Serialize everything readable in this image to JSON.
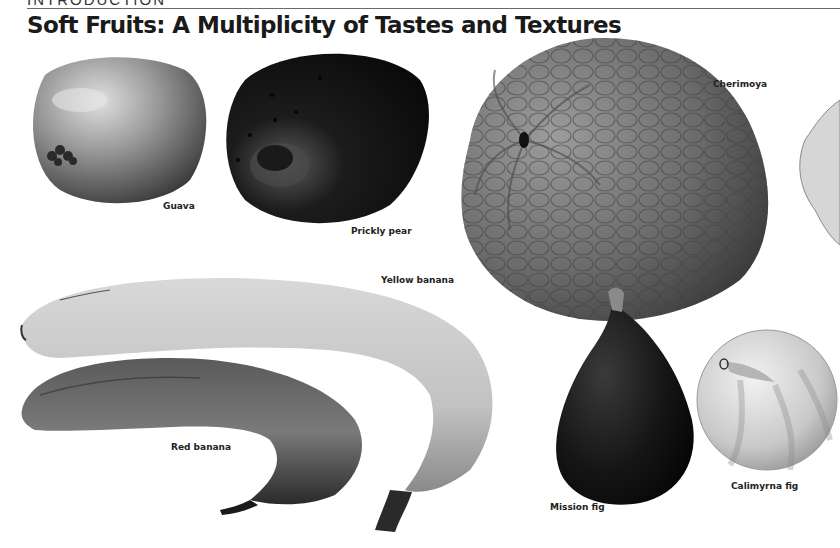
{
  "header": {
    "section": "INTRODUCTION",
    "title": "Soft Fruits: A Multiplicity of Tastes and Textures"
  },
  "illustrations": [
    {
      "id": "guava",
      "label": "Guava"
    },
    {
      "id": "prickly-pear",
      "label": "Prickly pear"
    },
    {
      "id": "cherimoya",
      "label": "Cherimoya"
    },
    {
      "id": "yellow-banana",
      "label": "Yellow banana"
    },
    {
      "id": "red-banana",
      "label": "Red banana"
    },
    {
      "id": "mission-fig",
      "label": "Mission fig"
    },
    {
      "id": "calimyrna-fig",
      "label": "Calimyrna fig"
    }
  ]
}
